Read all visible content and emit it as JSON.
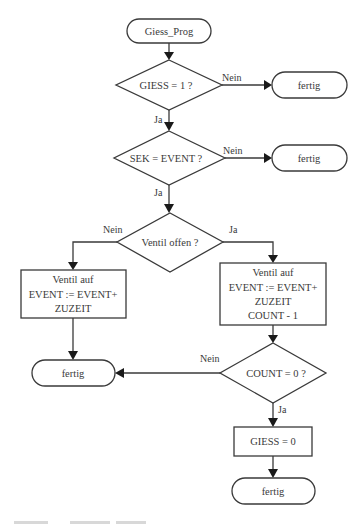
{
  "diagram": {
    "type": "flowchart",
    "colors": {
      "stroke": "#3a3a3a",
      "arrowhead": "#1a1a1a",
      "background": "#ffffff",
      "text": "#3a3a3a"
    },
    "start": {
      "label": "Giess_Prog"
    },
    "decisions": [
      {
        "id": "d1",
        "label": "GIESS = 1 ?",
        "yes": "Ja",
        "no": "Nein"
      },
      {
        "id": "d2",
        "label": "SEK = EVENT ?",
        "yes": "Ja",
        "no": "Nein"
      },
      {
        "id": "d3",
        "label": "Ventil offen ?",
        "yes": "Ja",
        "no": "Nein"
      },
      {
        "id": "d4",
        "label": "COUNT = 0 ?",
        "yes": "Ja",
        "no": "Nein"
      }
    ],
    "processes": [
      {
        "id": "p_left",
        "lines": [
          "Ventil auf",
          "EVENT := EVENT+",
          "ZUZEIT"
        ]
      },
      {
        "id": "p_right",
        "lines": [
          "Ventil auf",
          "EVENT := EVENT+",
          "ZUZEIT",
          "COUNT - 1"
        ]
      },
      {
        "id": "p_giess0",
        "lines": [
          "GIESS = 0"
        ]
      }
    ],
    "terminals": [
      {
        "id": "t1",
        "label": "fertig"
      },
      {
        "id": "t2",
        "label": "fertig"
      },
      {
        "id": "t3",
        "label": "fertig"
      },
      {
        "id": "t4",
        "label": "fertig"
      }
    ]
  }
}
